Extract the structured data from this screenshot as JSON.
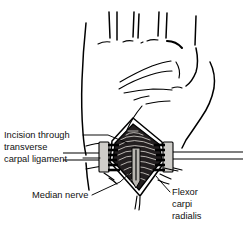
{
  "figure": {
    "background_color": "#ffffff",
    "ink_color": "#000000",
    "text_color": "#111111",
    "wound_color": "#231f20",
    "nerve_color": "#b9b6b1",
    "retractor_color": "#cfcdc9"
  },
  "labels": {
    "incision": {
      "line1": "Incision through",
      "line2": "transverse",
      "line3": "carpal ligament"
    },
    "median_nerve": "Median nerve",
    "flexor": {
      "line1": "Flexor",
      "line2": "carpi",
      "line3": "radialis"
    }
  },
  "anatomy": {
    "palm": "palm of hand",
    "fingers": "finger bases",
    "thumb": "thumb and thenar eminence",
    "wrist": "wrist crease",
    "forearm": "distal forearm",
    "incision_site": "longitudinal incision at wrist",
    "retractors": "self-retaining retractor blades",
    "exposed_nerve": "median nerve in carpal tunnel"
  }
}
